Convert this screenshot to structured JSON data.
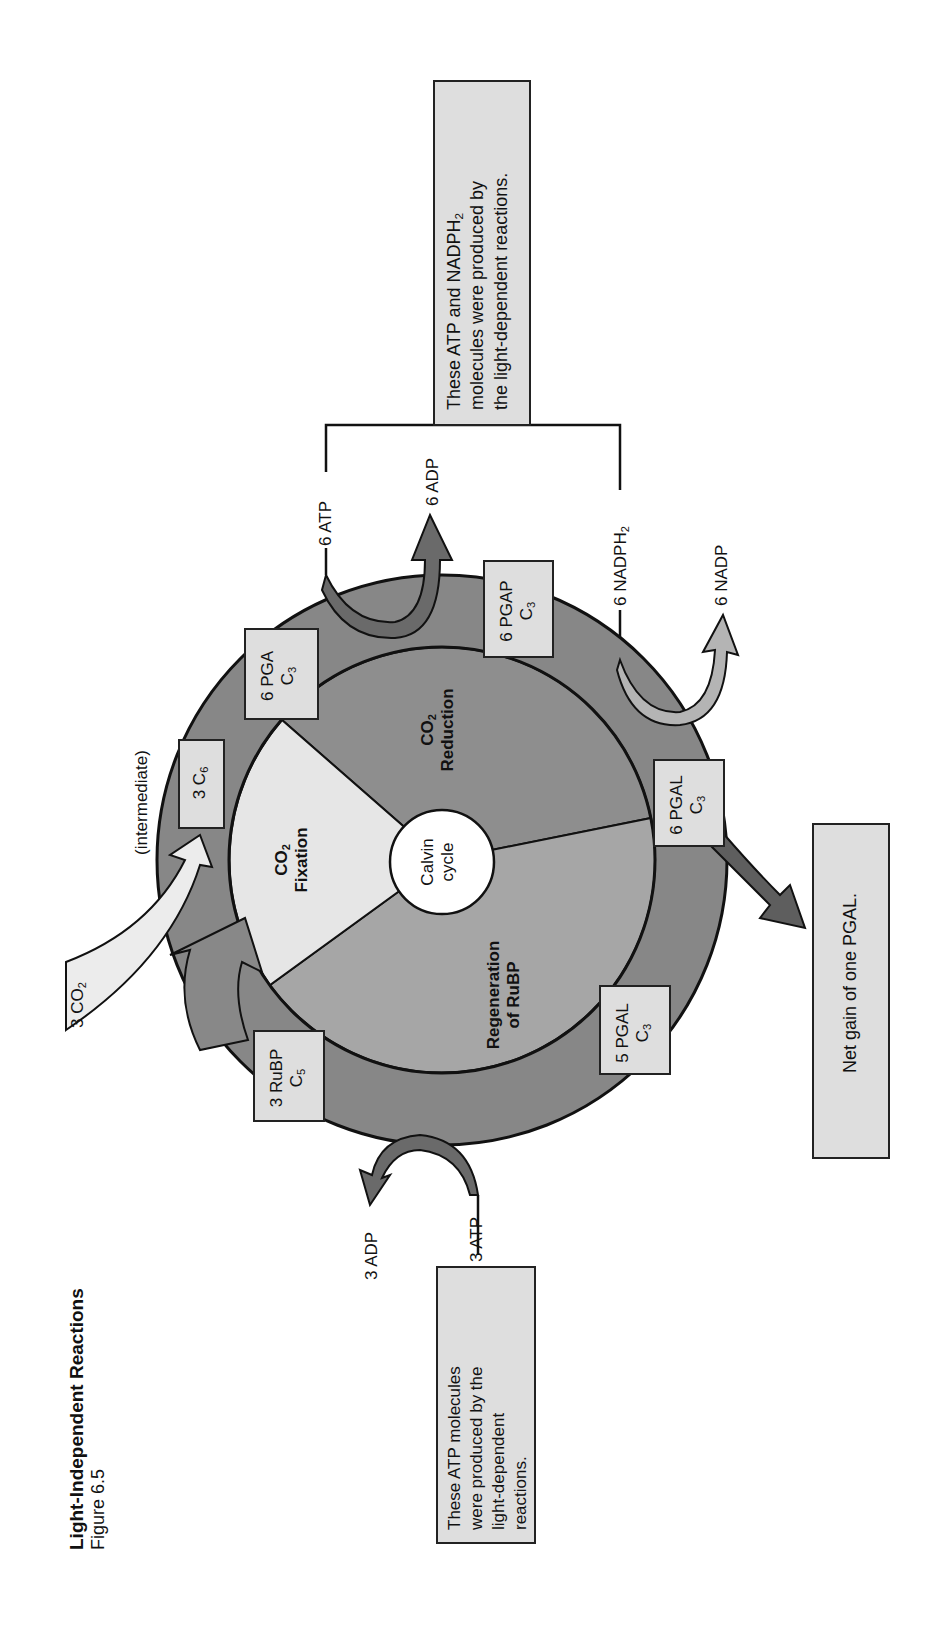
{
  "figure": {
    "title": "Light-Independent Reactions",
    "subtitle": "Figure 6.5"
  },
  "cycle": {
    "center_label_line1": "Calvin",
    "center_label_line2": "cycle",
    "sectors": [
      {
        "name": "CO2 Fixation",
        "line1": "CO",
        "sub": "2",
        "line2": "Fixation",
        "color": "#e6e6e6"
      },
      {
        "name": "CO2 Reduction",
        "line1": "CO",
        "sub": "2",
        "line2": "Reduction",
        "color": "#8e8e8e"
      },
      {
        "name": "Regeneration of RuBP",
        "line1": "Regeneration",
        "line2": "of RuBP",
        "color": "#a6a6a6"
      }
    ],
    "ring_color": "#878787",
    "box_color": "#dedede"
  },
  "molecules": {
    "c6": {
      "count": "3 C",
      "sub": "6",
      "note": "(intermediate)"
    },
    "pga": {
      "line1": "6 PGA",
      "line2": "C",
      "sub": "3"
    },
    "pgap": {
      "line1": "6 PGAP",
      "line2": "C",
      "sub": "3"
    },
    "pgal6": {
      "line1": "6 PGAL",
      "line2": "C",
      "sub": "3"
    },
    "pgal5": {
      "line1": "5 PGAL",
      "line2": "C",
      "sub": "3"
    },
    "rubp": {
      "line1": "3 RuBP",
      "line2": "C",
      "sub": "5"
    }
  },
  "inputs_outputs": {
    "co2_in": {
      "text": "3 CO",
      "sub": "2"
    },
    "atp6": "6 ATP",
    "adp6": "6 ADP",
    "nadph6": {
      "text": "6 NADPH",
      "sub": "2"
    },
    "nadp6": "6 NADP",
    "atp3": "3 ATP",
    "adp3": "3 ADP"
  },
  "notes": {
    "top_right": {
      "line1": "These ATP and NADPH",
      "line1_sub": "2",
      "line2": "molecules were produced by",
      "line3": "the light-dependent reactions."
    },
    "bottom_left": {
      "line1": "These ATP molecules",
      "line2": "were produced by the",
      "line3": "light-dependent",
      "line4": "reactions."
    },
    "net_gain": "Net gain of one PGAL."
  }
}
